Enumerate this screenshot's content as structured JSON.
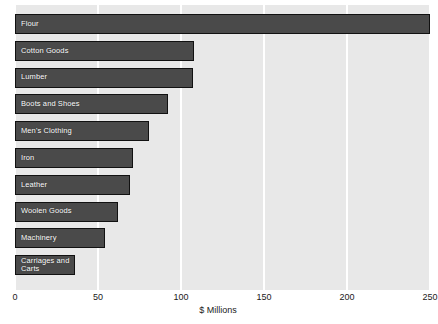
{
  "chart_data": {
    "type": "bar",
    "orientation": "horizontal",
    "title": "",
    "xlabel": "$ Millions",
    "ylabel": "",
    "xlim": [
      0,
      250
    ],
    "xticks": [
      0,
      50,
      100,
      150,
      200,
      250
    ],
    "xtick_labels": [
      "0",
      "50",
      "100",
      "150",
      "200",
      "250"
    ],
    "grid": "vertical-only",
    "legend": "none",
    "bar_color": "#4a4a4a",
    "bar_edge_color": "#111111",
    "plot_background": "#e8e8e8",
    "gridline_color": "#ffffff",
    "label_color": "#ffffff",
    "categories": [
      "Flour",
      "Cotton Goods",
      "Lumber",
      "Boots and Shoes",
      "Men's Clothing",
      "Iron",
      "Leather",
      "Woolen Goods",
      "Machinery",
      "Carriages and\nCarts"
    ],
    "values": [
      250,
      108,
      107,
      92,
      81,
      71,
      69,
      62,
      54,
      36
    ],
    "bars": [
      {
        "label": "Flour",
        "value": 250
      },
      {
        "label": "Cotton Goods",
        "value": 108
      },
      {
        "label": "Lumber",
        "value": 107
      },
      {
        "label": "Boots and Shoes",
        "value": 92
      },
      {
        "label": "Men's Clothing",
        "value": 81
      },
      {
        "label": "Iron",
        "value": 71
      },
      {
        "label": "Leather",
        "value": 69
      },
      {
        "label": "Woolen Goods",
        "value": 62
      },
      {
        "label": "Machinery",
        "value": 54
      },
      {
        "label": "Carriages and\nCarts",
        "value": 36
      }
    ]
  }
}
